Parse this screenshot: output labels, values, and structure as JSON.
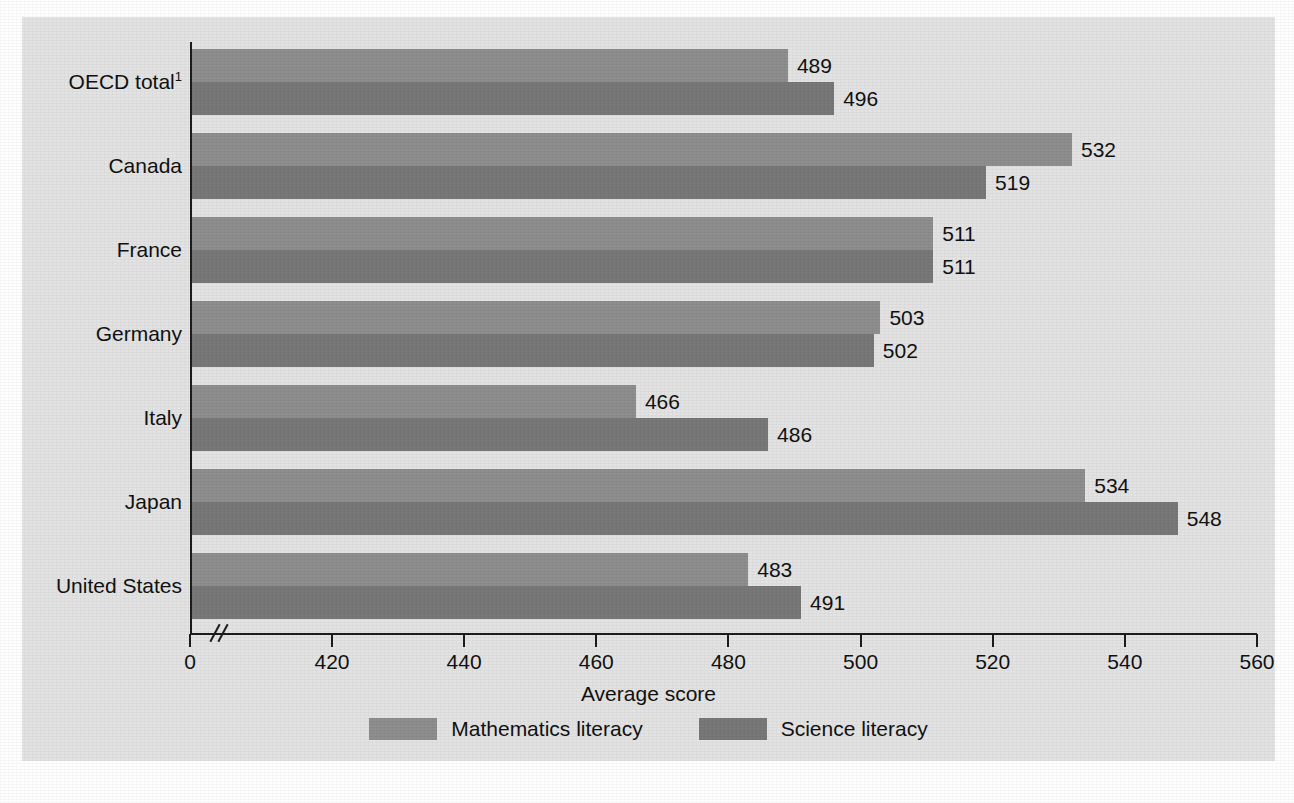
{
  "chart_data": {
    "type": "bar",
    "orientation": "horizontal",
    "title": "",
    "xlabel": "Average score",
    "ylabel": "",
    "xlim": [
      410,
      560
    ],
    "axis_break": true,
    "origin_label": "0",
    "grid": false,
    "legend_position": "bottom",
    "categories": [
      "OECD total",
      "Canada",
      "France",
      "Germany",
      "Italy",
      "Japan",
      "United States"
    ],
    "category_labels": [
      {
        "text": "OECD total",
        "footnote": "1"
      },
      {
        "text": "Canada",
        "footnote": ""
      },
      {
        "text": "France",
        "footnote": ""
      },
      {
        "text": "Germany",
        "footnote": ""
      },
      {
        "text": "Italy",
        "footnote": ""
      },
      {
        "text": "Japan",
        "footnote": ""
      },
      {
        "text": "United States",
        "footnote": ""
      }
    ],
    "series": [
      {
        "name": "Mathematics literacy",
        "color": "#8e8e8e",
        "values": [
          489,
          532,
          511,
          503,
          466,
          534,
          483
        ]
      },
      {
        "name": "Science literacy",
        "color": "#787878",
        "values": [
          496,
          519,
          511,
          502,
          486,
          548,
          491
        ]
      }
    ],
    "xticks": [
      0,
      420,
      440,
      460,
      480,
      500,
      520,
      540,
      560
    ],
    "xtick_labels": [
      "0",
      "420",
      "440",
      "460",
      "480",
      "500",
      "520",
      "540",
      "560"
    ],
    "value_labels": [
      [
        "489",
        "496"
      ],
      [
        "532",
        "519"
      ],
      [
        "511",
        "511"
      ],
      [
        "503",
        "502"
      ],
      [
        "466",
        "486"
      ],
      [
        "534",
        "548"
      ],
      [
        "483",
        "491"
      ]
    ]
  },
  "legend": {
    "entries": [
      {
        "label": "Mathematics literacy",
        "color": "#8e8e8e"
      },
      {
        "label": "Science literacy",
        "color": "#787878"
      }
    ]
  },
  "colors": {
    "panel_background": "#e3e3e3",
    "page_background": "#ffffff",
    "axis": "#1c1c1c",
    "text": "#111111",
    "mathematics": "#8e8e8e",
    "science": "#787878"
  }
}
